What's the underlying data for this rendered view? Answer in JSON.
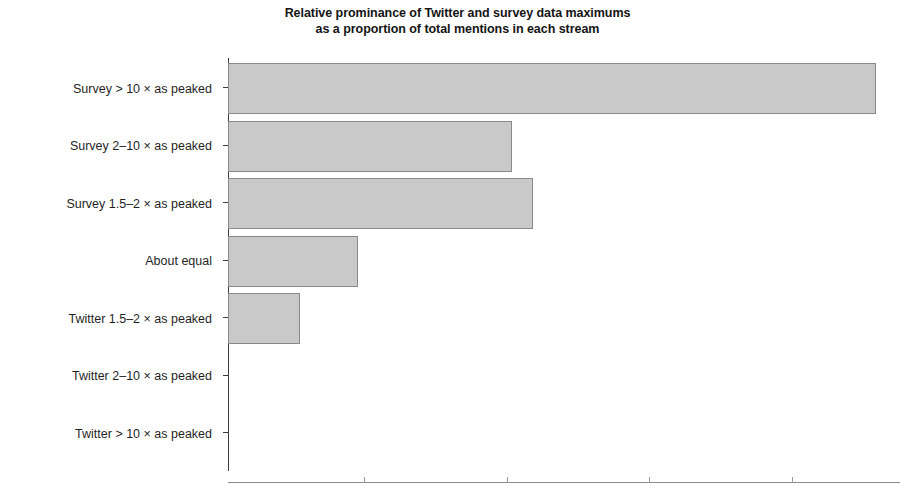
{
  "chart_data": {
    "type": "bar",
    "orientation": "horizontal",
    "title": "Relative prominance of Twitter and survey data maximums as a proportion of total mentions in each stream",
    "title_lines": [
      "Relative prominance of Twitter and survey data maximums",
      "as a proportion of total mentions in each stream"
    ],
    "xlabel": "",
    "ylabel": "",
    "categories": [
      "Survey > 10 × as peaked",
      "Survey 2–10 × as peaked",
      "Survey 1.5–2 × as peaked",
      "About equal",
      "Twitter 1.5–2 × as peaked",
      "Twitter 2–10 × as peaked",
      "Twitter > 10 × as peaked"
    ],
    "values": [
      1.0,
      0.438,
      0.471,
      0.201,
      0.111,
      0.0,
      0.0
    ],
    "xlim": [
      0,
      1.0
    ],
    "grid": false,
    "legend": false,
    "bar_fill_color": "#c9c9c9",
    "bar_edge_color": "#8a8a8a",
    "axis_color": "#3d3d3d",
    "x_tick_fractions": [
      0.21,
      0.43,
      0.65,
      0.87
    ]
  }
}
